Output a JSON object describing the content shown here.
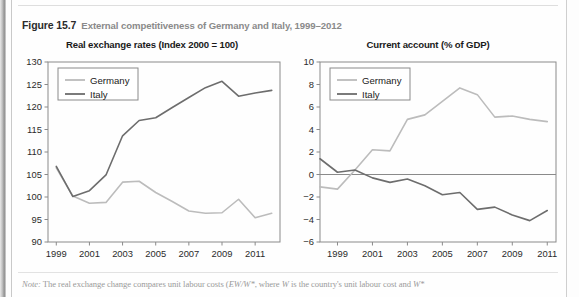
{
  "figure": {
    "number": "Figure 15.7",
    "title": "External competitiveness of Germany and Italy, 1999–2012"
  },
  "note": {
    "label": "Note:",
    "text_1": " The real exchange change compares unit labour costs (",
    "formula_1": "EW/W*",
    "text_2": ", where ",
    "formula_2": "W",
    "text_3": " is the country's unit labour cost and ",
    "formula_3": "W*"
  },
  "colors": {
    "germany": "#bcbcbc",
    "italy": "#6d6d6d",
    "axis": "#8a8a8a",
    "frame": "#8a8a8a",
    "zero_line": "#8a8a8a",
    "tick_label": "#2b2b2b",
    "background": "#fefefe"
  },
  "legend": {
    "germany_label": "Germany",
    "italy_label": "Italy"
  },
  "chart_data": [
    {
      "type": "line",
      "id": "real-exchange-rates",
      "title": "Real exchange rates (Index 2000 = 100)",
      "xlabel": "",
      "ylabel": "",
      "xlim": [
        1998.5,
        2012.5
      ],
      "ylim": [
        90,
        130
      ],
      "ytick_values": [
        90,
        95,
        100,
        105,
        110,
        115,
        120,
        125,
        130
      ],
      "ytick_labels": [
        "90",
        "95",
        "100",
        "105",
        "110",
        "115",
        "120",
        "125",
        "130"
      ],
      "xtick_values": [
        1999,
        2001,
        2003,
        2005,
        2007,
        2009,
        2011
      ],
      "xtick_labels": [
        "1999",
        "2001",
        "2003",
        "2005",
        "2007",
        "2009",
        "2011"
      ],
      "grid": false,
      "legend_position": "upper-left",
      "x": [
        1999,
        2000,
        2001,
        2002,
        2003,
        2004,
        2005,
        2006,
        2007,
        2008,
        2009,
        2010,
        2011,
        2012
      ],
      "series": [
        {
          "name": "Germany",
          "color": "#bcbcbc",
          "values": [
            106.5,
            100.2,
            98.6,
            98.8,
            103.3,
            103.5,
            101.0,
            99.0,
            96.9,
            96.4,
            96.5,
            99.5,
            95.4,
            96.4
          ]
        },
        {
          "name": "Italy",
          "color": "#6d6d6d",
          "values": [
            106.8,
            100.1,
            101.4,
            104.9,
            113.6,
            117.0,
            117.6,
            119.9,
            122.1,
            124.3,
            125.7,
            122.4,
            123.1,
            123.7
          ]
        }
      ]
    },
    {
      "type": "line",
      "id": "current-account",
      "title": "Current account (% of GDP)",
      "xlabel": "",
      "ylabel": "",
      "xlim": [
        1998.0,
        2011.5
      ],
      "ylim": [
        -6,
        10
      ],
      "ytick_values": [
        -6,
        -4,
        -2,
        0,
        2,
        4,
        6,
        8,
        10
      ],
      "ytick_labels": [
        "−6",
        "−4",
        "−2",
        "0",
        "2",
        "4",
        "6",
        "8",
        "10"
      ],
      "xtick_values": [
        1999,
        2001,
        2003,
        2005,
        2007,
        2009,
        2011
      ],
      "xtick_labels": [
        "1999",
        "2001",
        "2003",
        "2005",
        "2007",
        "2009",
        "2011"
      ],
      "grid": false,
      "zero_line": true,
      "legend_position": "upper-left",
      "x": [
        1998,
        1999,
        2000,
        2001,
        2002,
        2003,
        2004,
        2005,
        2006,
        2007,
        2008,
        2009,
        2010,
        2011
      ],
      "series": [
        {
          "name": "Germany",
          "color": "#bcbcbc",
          "values": [
            -1.1,
            -1.3,
            0.4,
            2.2,
            2.1,
            4.9,
            5.3,
            6.5,
            7.7,
            7.1,
            5.1,
            5.2,
            4.9,
            4.7
          ]
        },
        {
          "name": "Italy",
          "color": "#6d6d6d",
          "values": [
            1.4,
            0.2,
            0.4,
            -0.3,
            -0.7,
            -0.4,
            -1.0,
            -1.8,
            -1.6,
            -3.1,
            -2.9,
            -3.6,
            -4.1,
            -3.2
          ]
        }
      ]
    }
  ]
}
